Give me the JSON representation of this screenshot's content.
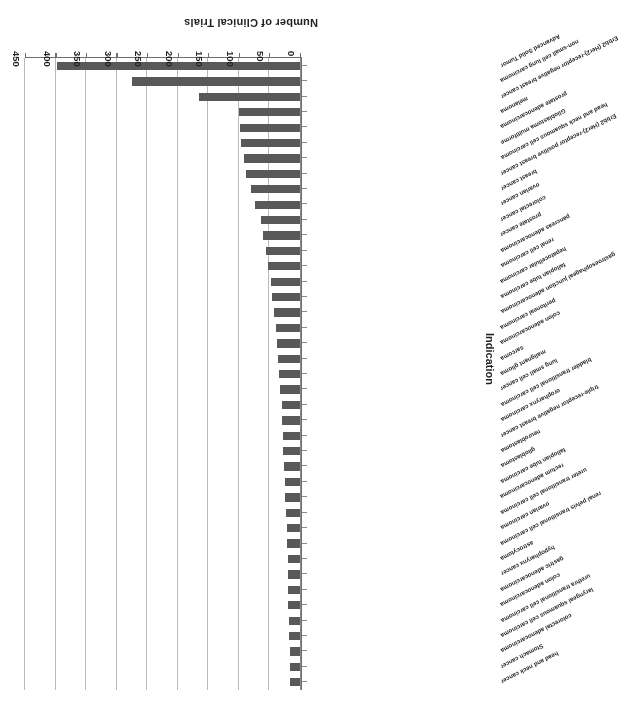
{
  "chart_data": {
    "type": "bar",
    "orientation": "horizontal",
    "title": "",
    "xlabel": "Number of Clinical Trials",
    "ylabel": "Indication",
    "xlim": [
      0,
      450
    ],
    "xticks": [
      0,
      50,
      100,
      150,
      200,
      250,
      300,
      350,
      400,
      450
    ],
    "grid": true,
    "legend": false,
    "bar_color": "#595959",
    "rotated_180": true,
    "categories": [
      "Advanced Solid Tumor",
      "non-small cell lung carcinoma",
      "Erbb2 (Her2)-receptor negative breast cancer",
      "melanoma",
      "prostate adenocarcinoma",
      "Glioblastoma multiforme",
      "head and neck squamous cell carcinoma",
      "Erbb2 (Her2)-receptor positive breast cancer",
      "breast cancer",
      "ovarian cancer",
      "colorectal cancer",
      "prostate cancer",
      "pancreas adenocarcinoma",
      "renal cell carcinoma",
      "hepatocellular carcinoma",
      "fallopian tube carcinoma",
      "gastroesophageal junction adenocarcinoma",
      "peritoneal carcinoma",
      "colon adenocarcinoma",
      "sarcoma",
      "malignant glioma",
      "lung small cell cancer",
      "bladder transitional cell carcinoma",
      "oropharynx carcinoma",
      "triple-receptor negative breast cancer",
      "neuroblastoma",
      "glioblastoma",
      "fallopian tube carcinoma",
      "rectum adenocarcinoma",
      "ureter transitional cell carcinoma",
      "ovarian carcinoma",
      "renal pelvis transitional cell carcinoma",
      "astrocytoma",
      "hypopharynx cancer",
      "gastric adenocarcinoma",
      "colon adenocarcinoma",
      "urethra transitional cell carcinoma",
      "laryngeal squamous cell carcinoma",
      "colorectal adenocarcinoma",
      "Stomach cancer",
      "head and neck cancer"
    ],
    "values": [
      398,
      275,
      165,
      100,
      98,
      96,
      92,
      88,
      80,
      73,
      64,
      60,
      55,
      52,
      48,
      45,
      42,
      40,
      38,
      36,
      34,
      32,
      30,
      29,
      28,
      27,
      26,
      25,
      24,
      23,
      22,
      21,
      20,
      20,
      19,
      19,
      18,
      18,
      17,
      17,
      16
    ]
  },
  "axes": {
    "x_title": "Number of Clinical Trials",
    "y_title": "Indication",
    "x_tick_labels": [
      "0",
      "50",
      "100",
      "150",
      "200",
      "250",
      "300",
      "350",
      "400",
      "450"
    ]
  }
}
